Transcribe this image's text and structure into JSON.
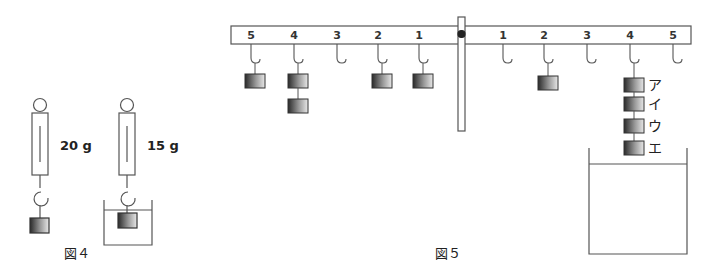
{
  "figure4": {
    "caption": "図４",
    "scale_air_reading": "20 g",
    "scale_water_reading": "15 g"
  },
  "figure5": {
    "caption": "図５",
    "left_positions": [
      "5",
      "4",
      "3",
      "2",
      "1"
    ],
    "right_positions": [
      "1",
      "2",
      "3",
      "4",
      "5"
    ],
    "left_weights": {
      "5": 1,
      "4": 2,
      "3": 0,
      "2": 1,
      "1": 1
    },
    "right_weights": {
      "1": 0,
      "2": 1,
      "3": 0,
      "4": 4,
      "5": 0
    },
    "weight_labels": [
      "ア",
      "イ",
      "ウ",
      "エ"
    ]
  },
  "colors": {
    "line": "#555555",
    "weight_dark": "#333333",
    "weight_light": "#dddddd"
  }
}
